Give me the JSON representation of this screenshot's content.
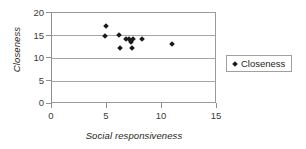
{
  "chart_data": {
    "type": "scatter",
    "title": "",
    "xlabel": "Social responsiveness",
    "ylabel": "Closeness",
    "xlim": [
      0,
      15
    ],
    "ylim": [
      0,
      20
    ],
    "xticks": [
      "0",
      "5",
      "10",
      "15"
    ],
    "yticks": [
      "0",
      "5",
      "10",
      "15",
      "20"
    ],
    "xtick_values": [
      0,
      5,
      10,
      15
    ],
    "ytick_values": [
      0,
      5,
      10,
      15,
      20
    ],
    "grid": "horizontal",
    "legend_position": "right",
    "series": [
      {
        "name": "Closeness",
        "marker": "diamond",
        "color": "#1a1a1a",
        "points": [
          {
            "x": 4.9,
            "y": 17.1
          },
          {
            "x": 4.85,
            "y": 15.0
          },
          {
            "x": 6.1,
            "y": 15.1
          },
          {
            "x": 6.2,
            "y": 12.2
          },
          {
            "x": 6.7,
            "y": 14.2
          },
          {
            "x": 7.0,
            "y": 14.2
          },
          {
            "x": 7.2,
            "y": 13.6
          },
          {
            "x": 7.3,
            "y": 12.2
          },
          {
            "x": 7.4,
            "y": 14.2
          },
          {
            "x": 8.2,
            "y": 14.2
          },
          {
            "x": 10.9,
            "y": 13.2
          }
        ]
      }
    ]
  },
  "legend": {
    "entries": [
      {
        "label": "Closeness"
      }
    ]
  },
  "axes": {
    "y_title": "Closeness",
    "x_title": "Social responsiveness"
  }
}
